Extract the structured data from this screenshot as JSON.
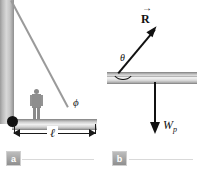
{
  "figure": {
    "panels": [
      {
        "tag": "a",
        "caption": "",
        "labels": {
          "angle": "ϕ",
          "length": "ℓ"
        },
        "elements": {
          "wall": "vertical-wall",
          "pivot": "pivot-point",
          "beam": "horizontal-beam",
          "cable": "diagonal-cable",
          "person": "person-silhouette",
          "dimension": "length-dimension-line"
        }
      },
      {
        "tag": "b",
        "caption": "",
        "labels": {
          "resultant": "R",
          "resultant_accent": "→",
          "angle": "θ",
          "weight": "W",
          "weight_subscript": "p"
        },
        "elements": {
          "beam": "horizontal-beam",
          "resultant_vector": "resultant-force-vector",
          "weight_vector": "weight-force-vector",
          "angle_arc": "theta-angle-arc"
        }
      }
    ],
    "colors": {
      "vector": "#111111",
      "beam_light": "#f2f2f2",
      "beam_dark": "#a0a0a0",
      "cable": "#9a9a9a",
      "tag_bg": "#8f8f8f",
      "background": "#ffffff"
    }
  }
}
